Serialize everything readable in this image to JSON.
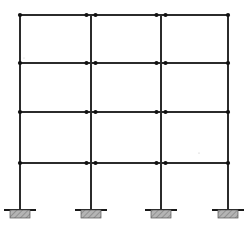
{
  "figure": {
    "kind": "structural-frame-elevation",
    "title": "",
    "width": 252,
    "height": 225,
    "background_color": "#ffffff",
    "line_color": "#2b2b2b",
    "node_color": "#111111",
    "footing_fill": "#b0b0b0",
    "footing_stroke": "#555555",
    "ground_line_color": "#1a1a1a"
  },
  "geometry": {
    "column_x": [
      20,
      91,
      161,
      228
    ],
    "beam_y": [
      15,
      63,
      112,
      163
    ],
    "base_y": 210,
    "ground_y": 211,
    "column_line_width": 1.1,
    "beam_line_width": 1.1,
    "node_radius": 2.1,
    "node_offset": 4.5
  },
  "columns": [
    {
      "id": "C1",
      "label": "column-1",
      "x": 20,
      "top_y": 15,
      "base_y": 210,
      "position": "exterior-left",
      "hinge_pairs": false
    },
    {
      "id": "C2",
      "label": "column-2",
      "x": 91,
      "top_y": 15,
      "base_y": 210,
      "position": "interior",
      "hinge_pairs": true
    },
    {
      "id": "C3",
      "label": "column-3",
      "x": 161,
      "top_y": 15,
      "base_y": 210,
      "position": "interior",
      "hinge_pairs": true
    },
    {
      "id": "C4",
      "label": "column-4",
      "x": 228,
      "top_y": 15,
      "base_y": 210,
      "position": "exterior-right",
      "hinge_pairs": false
    }
  ],
  "beams": [
    {
      "id": "B4",
      "label": "roof-beam",
      "level": 4,
      "y": 15,
      "x_start": 20,
      "x_end": 228
    },
    {
      "id": "B3",
      "label": "third-floor-beam",
      "level": 3,
      "y": 63,
      "x_start": 20,
      "x_end": 228
    },
    {
      "id": "B2",
      "label": "second-floor-beam",
      "level": 2,
      "y": 112,
      "x_start": 20,
      "x_end": 228
    },
    {
      "id": "B1",
      "label": "first-floor-beam",
      "level": 1,
      "y": 163,
      "x_start": 20,
      "x_end": 228
    }
  ],
  "nodes": [
    {
      "label": "node-L4-C1",
      "x": 20,
      "y": 15
    },
    {
      "label": "node-L4-C2-left",
      "x": 86.5,
      "y": 15
    },
    {
      "label": "node-L4-C2-right",
      "x": 95.5,
      "y": 15
    },
    {
      "label": "node-L4-C3-left",
      "x": 156.5,
      "y": 15
    },
    {
      "label": "node-L4-C3-right",
      "x": 165.5,
      "y": 15
    },
    {
      "label": "node-L4-C4",
      "x": 228,
      "y": 15
    },
    {
      "label": "node-L3-C1",
      "x": 20,
      "y": 63
    },
    {
      "label": "node-L3-C2-left",
      "x": 86.5,
      "y": 63
    },
    {
      "label": "node-L3-C2-right",
      "x": 95.5,
      "y": 63
    },
    {
      "label": "node-L3-C3-left",
      "x": 156.5,
      "y": 63
    },
    {
      "label": "node-L3-C3-right",
      "x": 165.5,
      "y": 63
    },
    {
      "label": "node-L3-C4",
      "x": 228,
      "y": 63
    },
    {
      "label": "node-L2-C1",
      "x": 20,
      "y": 112
    },
    {
      "label": "node-L2-C2-left",
      "x": 86.5,
      "y": 112
    },
    {
      "label": "node-L2-C2-right",
      "x": 95.5,
      "y": 112
    },
    {
      "label": "node-L2-C3-left",
      "x": 156.5,
      "y": 112
    },
    {
      "label": "node-L2-C3-right",
      "x": 165.5,
      "y": 112
    },
    {
      "label": "node-L2-C4",
      "x": 228,
      "y": 112
    },
    {
      "label": "node-L1-C1",
      "x": 20,
      "y": 163
    },
    {
      "label": "node-L1-C2-left",
      "x": 86.5,
      "y": 163
    },
    {
      "label": "node-L1-C2-right",
      "x": 95.5,
      "y": 163
    },
    {
      "label": "node-L1-C3-left",
      "x": 156.5,
      "y": 163
    },
    {
      "label": "node-L1-C3-right",
      "x": 165.5,
      "y": 163
    },
    {
      "label": "node-L1-C4",
      "x": 228,
      "y": 163
    }
  ],
  "supports": [
    {
      "label": "fixed-support-1",
      "column": "C1",
      "x": 20,
      "y": 210,
      "type": "fixed",
      "footing_width": 20,
      "footing_height": 8,
      "ground_line_width": 32
    },
    {
      "label": "fixed-support-2",
      "column": "C2",
      "x": 91,
      "y": 210,
      "type": "fixed",
      "footing_width": 20,
      "footing_height": 8,
      "ground_line_width": 32
    },
    {
      "label": "fixed-support-3",
      "column": "C3",
      "x": 161,
      "y": 210,
      "type": "fixed",
      "footing_width": 20,
      "footing_height": 8,
      "ground_line_width": 32
    },
    {
      "label": "fixed-support-4",
      "column": "C4",
      "x": 228,
      "y": 210,
      "type": "fixed",
      "footing_width": 20,
      "footing_height": 8,
      "ground_line_width": 32
    }
  ],
  "bays": [
    {
      "label": "bay-1",
      "x_start": 20,
      "x_end": 91
    },
    {
      "label": "bay-2",
      "x_start": 91,
      "x_end": 161
    },
    {
      "label": "bay-3",
      "x_start": 161,
      "x_end": 228
    }
  ],
  "storeys": [
    {
      "label": "storey-1",
      "y_top": 163,
      "y_bottom": 210
    },
    {
      "label": "storey-2",
      "y_top": 112,
      "y_bottom": 163
    },
    {
      "label": "storey-3",
      "y_top": 63,
      "y_bottom": 112
    },
    {
      "label": "storey-4",
      "y_top": 15,
      "y_bottom": 63
    }
  ],
  "annotations": {
    "stray_mark_1": {
      "label": "stray-speck",
      "x": 24,
      "y": 58,
      "size": 1
    },
    "stray_mark_2": {
      "label": "stray-speck",
      "x": 199,
      "y": 153,
      "size": 1.2
    }
  }
}
